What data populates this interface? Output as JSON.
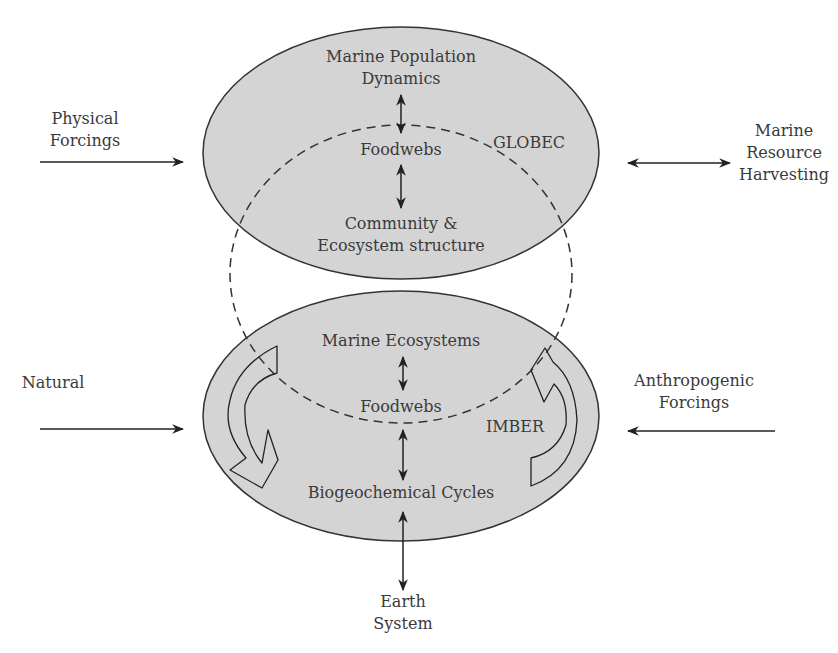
{
  "diagram": {
    "top_ellipse": {
      "label": "GLOBEC",
      "nodes": [
        {
          "line1": "Marine Population",
          "line2": "Dynamics"
        },
        {
          "line1": "Foodwebs"
        },
        {
          "line1": "Community &",
          "line2": "Ecosystem structure"
        }
      ]
    },
    "bottom_ellipse": {
      "label": "IMBER",
      "nodes": [
        {
          "line1": "Marine Ecosystems"
        },
        {
          "line1": "Foodwebs"
        },
        {
          "line1": "Biogeochemical Cycles"
        }
      ]
    },
    "external": {
      "physical_forcings": {
        "line1": "Physical",
        "line2": "Forcings"
      },
      "marine_resource_harvesting": {
        "line1": "Marine",
        "line2": "Resource",
        "line3": "Harvesting"
      },
      "natural": {
        "line1": "Natural"
      },
      "anthropogenic_forcings": {
        "line1": "Anthropogenic",
        "line2": "Forcings"
      },
      "earth_system": {
        "line1": "Earth",
        "line2": "System"
      }
    },
    "colors": {
      "ellipse_fill": "#d4d4d4",
      "stroke": "#333333",
      "text": "#3a3a3a"
    }
  }
}
